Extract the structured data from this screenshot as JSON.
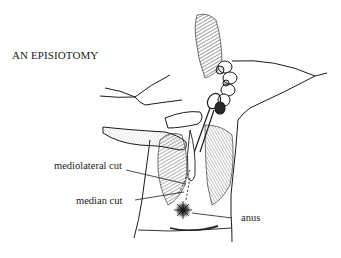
{
  "figure": {
    "title": "AN EPISIOTOMY",
    "labels": {
      "mediolateral": "mediolateral cut",
      "median": "median cut",
      "anus": "anus"
    },
    "colors": {
      "ink": "#1a1a1a",
      "background": "#ffffff",
      "shading": "#3a3a3a"
    }
  }
}
